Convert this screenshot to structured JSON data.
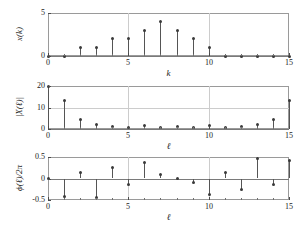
{
  "figure": {
    "kind": "three-panel-stem-plot",
    "background": "#ffffff",
    "stem_color": "#555555",
    "marker_color": "#3a3a3a",
    "axis_color": "#9a9a9a",
    "grid_color": "#cccccc"
  },
  "chart_data": [
    {
      "type": "stem",
      "panel": "top",
      "title": "",
      "xlabel": "k",
      "ylabel": "x(k)",
      "x": [
        0,
        1,
        2,
        3,
        4,
        5,
        6,
        7,
        8,
        9,
        10,
        11,
        12,
        13,
        14,
        15
      ],
      "values": [
        0,
        0,
        1,
        1,
        2,
        2,
        3,
        4,
        3,
        2,
        1,
        0,
        0,
        0,
        0,
        0
      ],
      "xlim": [
        0,
        15
      ],
      "ylim": [
        0,
        5
      ],
      "xticks": [
        0,
        5,
        10,
        15
      ],
      "xticklabels": [
        "0",
        "5",
        "10",
        "15"
      ],
      "yticks": [
        0,
        5
      ],
      "yticklabels": [
        "0",
        "5"
      ],
      "xminorticks": [
        1,
        2,
        3,
        4,
        6,
        7,
        8,
        9,
        11,
        12,
        13,
        14
      ],
      "grid": true,
      "gridlines_v": [
        5,
        10
      ],
      "gridlines_h": []
    },
    {
      "type": "stem",
      "panel": "middle",
      "title": "",
      "xlabel": "ℓ",
      "ylabel": "|X(ℓ)|",
      "x": [
        0,
        1,
        2,
        3,
        4,
        5,
        6,
        7,
        8,
        9,
        10,
        11,
        12,
        13,
        14,
        15
      ],
      "values": [
        20,
        13.2,
        4.5,
        2.3,
        1.0,
        0.5,
        1.4,
        0.9,
        1.0,
        0.9,
        1.4,
        0.5,
        1.0,
        2.3,
        4.5,
        13.2
      ],
      "xlim": [
        0,
        15
      ],
      "ylim": [
        0,
        20
      ],
      "xticks": [
        0,
        5,
        10,
        15
      ],
      "xticklabels": [
        "0",
        "5",
        "10",
        "15"
      ],
      "yticks": [
        0,
        10,
        20
      ],
      "yticklabels": [
        "0",
        "10",
        "20"
      ],
      "xminorticks": [
        1,
        2,
        3,
        4,
        6,
        7,
        8,
        9,
        11,
        12,
        13,
        14
      ],
      "grid": true,
      "gridlines_v": [
        5,
        10
      ],
      "gridlines_h": [
        10
      ]
    },
    {
      "type": "stem",
      "panel": "bottom",
      "title": "",
      "xlabel": "ℓ",
      "ylabel": "ϕ(ℓ)/2π",
      "x": [
        0,
        1,
        2,
        3,
        4,
        5,
        6,
        7,
        8,
        9,
        10,
        11,
        12,
        13,
        14,
        15
      ],
      "values": [
        0,
        -0.41,
        0.13,
        -0.45,
        0.26,
        -0.14,
        0.38,
        0.1,
        0.01,
        -0.09,
        -0.38,
        0.15,
        -0.26,
        0.46,
        -0.13,
        0.42
      ],
      "xlim": [
        0,
        15
      ],
      "ylim": [
        -0.5,
        0.5
      ],
      "xticks": [
        0,
        5,
        10,
        15
      ],
      "xticklabels": [
        "0",
        "5",
        "10",
        "15"
      ],
      "yticks": [
        -0.5,
        0,
        0.5
      ],
      "yticklabels": [
        "-0.5",
        "0",
        "0.5"
      ],
      "xminorticks": [
        1,
        2,
        3,
        4,
        6,
        7,
        8,
        9,
        11,
        12,
        13,
        14
      ],
      "grid": true,
      "gridlines_v": [
        5,
        10
      ],
      "gridlines_h": [
        0
      ]
    }
  ],
  "labels": {
    "panel1": {
      "ylabel": "x(k)",
      "xlabel": "k",
      "yticks": [
        "5",
        "0"
      ],
      "xticks": [
        "0",
        "5",
        "10",
        "15"
      ]
    },
    "panel2": {
      "ylabel_pre": "|X(",
      "ylabel_var": "ℓ",
      "ylabel_post": ")|",
      "ylabel": "|X(ℓ)|",
      "xlabel": "ℓ",
      "yticks": [
        "20",
        "10",
        "0"
      ],
      "xticks": [
        "0",
        "5",
        "10",
        "15"
      ]
    },
    "panel3": {
      "ylabel": "ϕ(ℓ)/2π",
      "xlabel": "ℓ",
      "yticks": [
        "0.5",
        "0",
        "−0.5"
      ],
      "xticks": [
        "0",
        "5",
        "10",
        "15"
      ]
    }
  }
}
